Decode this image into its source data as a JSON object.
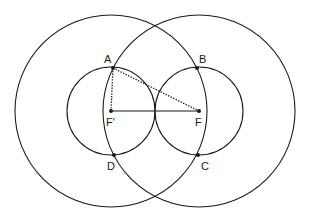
{
  "diagram": {
    "type": "geometry-construction",
    "stroke_color": "#1a1a1a",
    "background": "#ffffff",
    "circles": [
      {
        "id": "large-left",
        "cx": 111,
        "cy": 111,
        "r": 96
      },
      {
        "id": "large-right",
        "cx": 199,
        "cy": 111,
        "r": 96
      },
      {
        "id": "small-left",
        "cx": 111,
        "cy": 111,
        "r": 44
      },
      {
        "id": "small-right",
        "cx": 199,
        "cy": 111,
        "r": 44
      }
    ],
    "points": [
      {
        "id": "A",
        "label": "A",
        "x": 113,
        "y": 68,
        "lx": 104,
        "ly": 63
      },
      {
        "id": "B",
        "label": "B",
        "x": 197,
        "y": 68,
        "lx": 199,
        "ly": 63
      },
      {
        "id": "C",
        "label": "C",
        "x": 198,
        "y": 155,
        "lx": 201,
        "ly": 170
      },
      {
        "id": "D",
        "label": "D",
        "x": 114,
        "y": 155,
        "lx": 107,
        "ly": 170
      },
      {
        "id": "F1",
        "label": "F′",
        "x": 111,
        "y": 111,
        "lx": 106,
        "ly": 126
      },
      {
        "id": "F",
        "label": "F",
        "x": 199,
        "y": 111,
        "lx": 195,
        "ly": 126
      }
    ],
    "segments": [
      {
        "id": "F1-F",
        "from": "F1",
        "to": "F",
        "style": "solid"
      },
      {
        "id": "A-F1",
        "from": "A",
        "to": "F1",
        "style": "dotted"
      },
      {
        "id": "A-F",
        "from": "A",
        "to": "F",
        "style": "dotted"
      }
    ]
  }
}
